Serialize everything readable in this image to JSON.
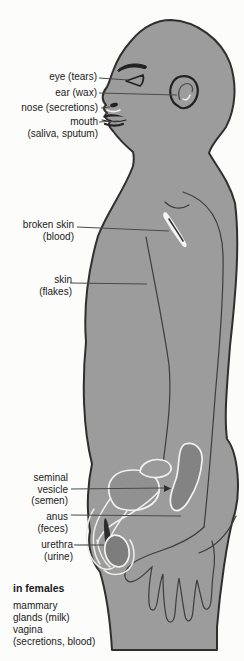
{
  "labels": {
    "eye": "eye (tears)",
    "ear": "ear (wax)",
    "nose": "nose (secretions)",
    "mouth": "mouth\n(saliva, sputum)",
    "broken_skin": "broken skin\n(blood)",
    "skin": "skin\n(flakes)",
    "seminal_vesicle": "seminal\nvesicle\n(semen)",
    "anus": "anus\n(feces)",
    "urethra": "urethra\n(urine)"
  },
  "females_note": {
    "heading": "in females",
    "items": [
      "mammary\nglands (milk)",
      "vagina\n(secretions, blood)"
    ]
  },
  "colors": {
    "background": "#fcfcfa",
    "body": "#9c9c9c",
    "organ_dark": "#838383",
    "bladder": "#919191",
    "vesicle": "#9a9a9a",
    "testis": "#7d7d7d",
    "shaft_shadow": "#2e2e2e",
    "cut_highlight": "#f4f4f4",
    "outline": "#2f2f2f",
    "text": "#1b1b1b"
  }
}
